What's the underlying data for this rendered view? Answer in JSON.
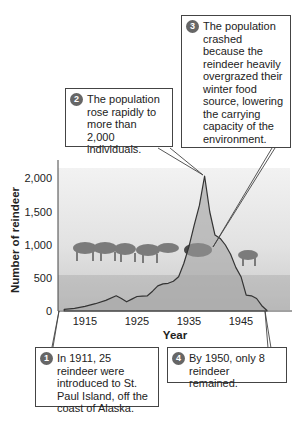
{
  "chart_data": {
    "type": "area",
    "title": "",
    "xlabel": "Year",
    "ylabel": "Number of reindeer",
    "x_ticks": [
      "1915",
      "1925",
      "1935",
      "1945"
    ],
    "y_ticks": [
      "0",
      "500",
      "1,000",
      "1,500",
      "2,000"
    ],
    "ylim": [
      0,
      2300
    ],
    "xlim": [
      1910,
      1952
    ],
    "grid": false,
    "series": [
      {
        "name": "Reindeer population",
        "x": [
          1911,
          1913,
          1915,
          1917,
          1919,
          1921,
          1922,
          1923,
          1924,
          1925,
          1926,
          1927,
          1928,
          1929,
          1930,
          1931,
          1932,
          1933,
          1934,
          1935,
          1936,
          1937,
          1938,
          1939,
          1940,
          1941,
          1942,
          1943,
          1944,
          1945,
          1946,
          1947,
          1948,
          1949,
          1950
        ],
        "values": [
          25,
          40,
          70,
          110,
          160,
          230,
          190,
          140,
          180,
          220,
          225,
          230,
          300,
          380,
          410,
          420,
          450,
          520,
          720,
          980,
          1300,
          1600,
          2046,
          1500,
          1150,
          1100,
          1000,
          860,
          660,
          520,
          240,
          230,
          190,
          80,
          8
        ]
      }
    ],
    "annotations": [
      {
        "number": "1",
        "text": "In 1911, 25 reindeer were introduced to St. Paul Island, off the coast of Alaska.",
        "points_to": {
          "x": 1911,
          "y": 25
        }
      },
      {
        "number": "2",
        "text": "The population rose rapidly to more than 2,000 individuals.",
        "points_to": {
          "x": 1938,
          "y": 2046
        }
      },
      {
        "number": "3",
        "text": "The population crashed because the reindeer heavily overgrazed their winter food source, lowering the carrying capacity of the environment.",
        "points_to": {
          "x": 1940,
          "y": 1150
        }
      },
      {
        "number": "4",
        "text": "By 1950, only 8 reindeer remained.",
        "points_to": {
          "x": 1950,
          "y": 8
        }
      }
    ]
  },
  "callouts": {
    "c1": {
      "num": "1",
      "text": "In 1911, 25 reindeer were introduced to St. Paul Island, off the coast of Alaska."
    },
    "c2": {
      "num": "2",
      "text": "The population rose rapidly to more than 2,000 individuals."
    },
    "c3": {
      "num": "3",
      "text": "The population crashed because the reindeer heavily overgrazed their winter food source, lowering the carrying capacity of the environment."
    },
    "c4": {
      "num": "4",
      "text": "By 1950, only 8 reindeer remained."
    }
  },
  "axes": {
    "xlabel": "Year",
    "ylabel": "Number of reindeer",
    "x_ticks": [
      "1915",
      "1925",
      "1935",
      "1945"
    ],
    "y_ticks": [
      "0",
      "500",
      "1,000",
      "1,500",
      "2,000"
    ]
  },
  "colors": {
    "line": "#333333",
    "fill": "#b9b9b9",
    "photo_bg": "#e4e4e4",
    "callout_border": "#444444",
    "badge": "#666666"
  }
}
